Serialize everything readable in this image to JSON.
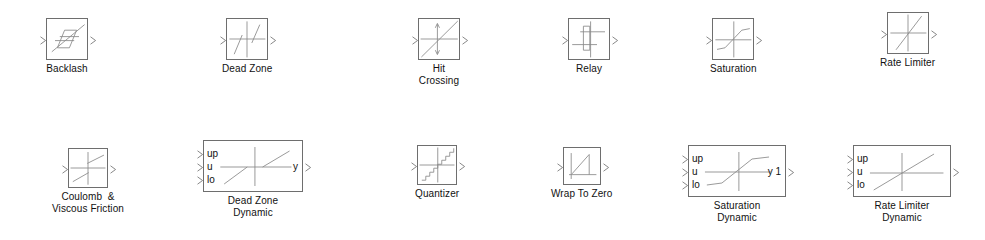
{
  "window": {
    "title": "Simulink Library — Discontinuities",
    "background_color": "#ffffff",
    "width": 985,
    "height": 240
  },
  "style": {
    "block_border_color": "#6e6e6e",
    "icon_stroke_color": "#8a8a8a",
    "label_color": "#111111",
    "port_color": "#7a7a7a"
  },
  "blocks": [
    {
      "id": "backlash",
      "name": "Backlash",
      "label": "Backlash",
      "icon": "backlash-hysteresis-icon",
      "row": 1,
      "x": 46,
      "y": 18,
      "w": 42,
      "h": 42,
      "inputs": [],
      "outputs": [],
      "input_count": 1,
      "output_count": 1
    },
    {
      "id": "dead-zone",
      "name": "Dead Zone",
      "label": "Dead Zone",
      "icon": "dead-zone-curve-icon",
      "row": 1,
      "x": 222,
      "y": 18,
      "w": 42,
      "h": 42,
      "inputs": [],
      "outputs": [],
      "input_count": 1,
      "output_count": 1
    },
    {
      "id": "hit-crossing",
      "name": "Hit Crossing",
      "label": "Hit\nCrossing",
      "icon": "hit-crossing-icon",
      "row": 1,
      "x": 418,
      "y": 18,
      "w": 42,
      "h": 42,
      "inputs": [],
      "outputs": [],
      "input_count": 1,
      "output_count": 1
    },
    {
      "id": "relay",
      "name": "Relay",
      "label": "Relay",
      "icon": "relay-hysteresis-icon",
      "row": 1,
      "x": 568,
      "y": 18,
      "w": 42,
      "h": 42,
      "inputs": [],
      "outputs": [],
      "input_count": 1,
      "output_count": 1
    },
    {
      "id": "saturation",
      "name": "Saturation",
      "label": "Saturation",
      "icon": "saturation-curve-icon",
      "row": 1,
      "x": 710,
      "y": 18,
      "w": 42,
      "h": 42,
      "inputs": [],
      "outputs": [],
      "input_count": 1,
      "output_count": 1
    },
    {
      "id": "rate-limiter",
      "name": "Rate Limiter",
      "label": "Rate Limiter",
      "icon": "rate-limiter-ramp-icon",
      "row": 1,
      "x": 880,
      "y": 12,
      "w": 42,
      "h": 42,
      "inputs": [],
      "outputs": [],
      "input_count": 1,
      "output_count": 1
    },
    {
      "id": "coulomb-viscous-friction",
      "name": "Coulomb & Viscous Friction",
      "label": "Coulomb  &\nViscous Friction",
      "icon": "coulomb-friction-icon",
      "row": 2,
      "x": 52,
      "y": 148,
      "w": 40,
      "h": 40,
      "inputs": [],
      "outputs": [],
      "input_count": 1,
      "output_count": 1
    },
    {
      "id": "dead-zone-dynamic",
      "name": "Dead Zone Dynamic",
      "label": "Dead Zone\nDynamic",
      "icon": "dead-zone-dynamic-curve-icon",
      "row": 2,
      "x": 203,
      "y": 140,
      "w": 100,
      "h": 52,
      "inputs": [
        "up",
        "u",
        "lo"
      ],
      "outputs": [
        "y"
      ],
      "input_count": 3,
      "output_count": 1
    },
    {
      "id": "quantizer",
      "name": "Quantizer",
      "label": "Quantizer",
      "icon": "quantizer-staircase-icon",
      "row": 2,
      "x": 415,
      "y": 145,
      "w": 40,
      "h": 40,
      "inputs": [],
      "outputs": [],
      "input_count": 1,
      "output_count": 1
    },
    {
      "id": "wrap-to-zero",
      "name": "Wrap To Zero",
      "label": "Wrap To Zero",
      "icon": "wrap-to-zero-icon",
      "row": 2,
      "x": 551,
      "y": 147,
      "w": 38,
      "h": 38,
      "inputs": [],
      "outputs": [],
      "input_count": 1,
      "output_count": 1
    },
    {
      "id": "saturation-dynamic",
      "name": "Saturation Dynamic",
      "label": "Saturation\nDynamic",
      "icon": "saturation-dynamic-curve-icon",
      "row": 2,
      "x": 688,
      "y": 145,
      "w": 98,
      "h": 52,
      "inputs": [
        "up",
        "u",
        "lo"
      ],
      "outputs": [
        "y 1"
      ],
      "input_count": 3,
      "output_count": 1
    },
    {
      "id": "rate-limiter-dynamic",
      "name": "Rate Limiter Dynamic",
      "label": "Rate Limiter\nDynamic",
      "icon": "rate-limiter-dynamic-ramp-icon",
      "row": 2,
      "x": 853,
      "y": 145,
      "w": 98,
      "h": 52,
      "inputs": [
        "up",
        "u",
        "lo"
      ],
      "outputs": [
        ""
      ],
      "input_count": 3,
      "output_count": 1
    }
  ]
}
